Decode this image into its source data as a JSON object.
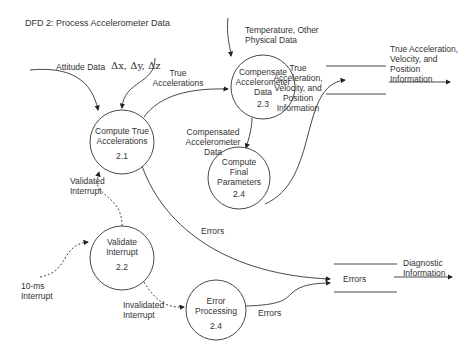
{
  "diagram": {
    "title": "DFD 2: Process Accelerometer Data",
    "processes": [
      {
        "id": "2.1",
        "label_line1": "Compute True",
        "label_line2": "Accelerations",
        "number": "2.1"
      },
      {
        "id": "2.2",
        "label_line1": "Validate",
        "label_line2": "Interrupt",
        "number": "2.2"
      },
      {
        "id": "2.3",
        "label_line1": "Compensate",
        "label_line2": "Accelerometer",
        "label_line3": "Data",
        "number": "2.3"
      },
      {
        "id": "2.4a",
        "label_line1": "Compute",
        "label_line2": "Final",
        "label_line3": "Parameters",
        "number": "2.4"
      },
      {
        "id": "2.4b",
        "label_line1": "Error",
        "label_line2": "Processing",
        "number": "2.4"
      }
    ],
    "stores": [
      {
        "id": "nav-output",
        "label_line1": "True Acceleration,",
        "label_line2": "Velocity, and",
        "label_line3": "Position",
        "label_line4": "Information"
      },
      {
        "id": "errors",
        "label": "Errors"
      }
    ],
    "flows": {
      "attitude_data": "Attitude Data",
      "deltas": "Δx, Δy, Δz",
      "true_accel_line1": "True",
      "true_accel_line2": "Accelerations",
      "temp_line1": "Temperature, Other",
      "temp_line2": "Physical Data",
      "tavp_line1": "True",
      "tavp_line2": "Acceleration,",
      "tavp_line3": "Velocity, and",
      "tavp_line4": "Position",
      "tavp_line5": "Information",
      "comp_line1": "Compensated",
      "comp_line2": "Accelerometer",
      "comp_line3": "Data",
      "validated_line1": "Validated",
      "validated_line2": "Interrupt",
      "interrupt_line1": "10-ms",
      "interrupt_line2": "Interrupt",
      "invalidated_line1": "Invalidated",
      "invalidated_line2": "Interrupt",
      "errors_from_21": "Errors",
      "errors_from_24": "Errors",
      "diag_line1": "Diagnostic",
      "diag_line2": "Information"
    }
  }
}
